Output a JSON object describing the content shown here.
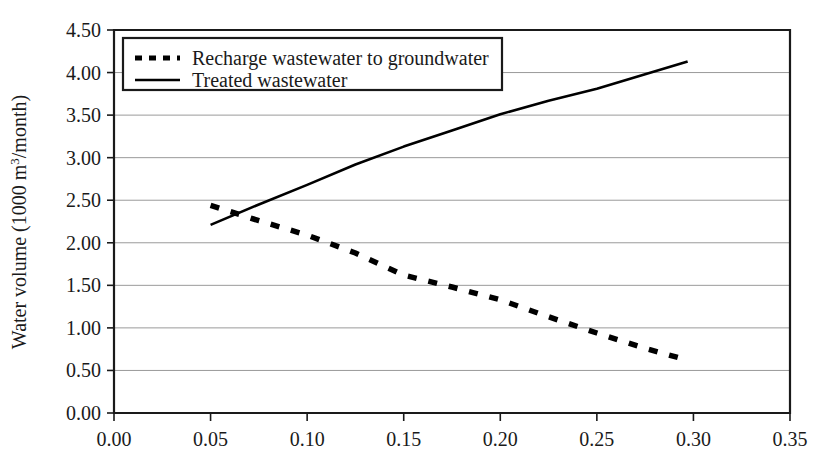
{
  "chart_data": {
    "type": "line",
    "title": "",
    "xlabel": "",
    "ylabel": "Water volume (1000 m³/month)",
    "ylabel_parts": {
      "before": "Water volume (1000 m",
      "sup": "3",
      "after": "/month)"
    },
    "xlim": [
      0.0,
      0.35
    ],
    "ylim": [
      0.0,
      4.5
    ],
    "xticks": [
      "0.00",
      "0.05",
      "0.10",
      "0.15",
      "0.20",
      "0.25",
      "0.30",
      "0.35"
    ],
    "xtick_values": [
      0.0,
      0.05,
      0.1,
      0.15,
      0.2,
      0.25,
      0.3,
      0.35
    ],
    "yticks": [
      "0.00",
      "0.50",
      "1.00",
      "1.50",
      "2.00",
      "2.50",
      "3.00",
      "3.50",
      "4.00",
      "4.50"
    ],
    "ytick_values": [
      0.0,
      0.5,
      1.0,
      1.5,
      2.0,
      2.5,
      3.0,
      3.5,
      4.0,
      4.5
    ],
    "grid": "horizontal",
    "legend_position": "top-left-inside",
    "series": [
      {
        "name": "Recharge wastewater to groundwater",
        "style": "dashed",
        "color": "#000000",
        "x": [
          0.05,
          0.075,
          0.1,
          0.125,
          0.15,
          0.175,
          0.2,
          0.225,
          0.25,
          0.275,
          0.297
        ],
        "values": [
          2.44,
          2.26,
          2.09,
          1.88,
          1.62,
          1.48,
          1.33,
          1.13,
          0.94,
          0.76,
          0.62
        ]
      },
      {
        "name": "Treated wastewater",
        "style": "solid",
        "color": "#000000",
        "x": [
          0.05,
          0.075,
          0.1,
          0.125,
          0.15,
          0.175,
          0.2,
          0.225,
          0.25,
          0.275,
          0.297
        ],
        "values": [
          2.21,
          2.45,
          2.68,
          2.92,
          3.13,
          3.32,
          3.51,
          3.67,
          3.81,
          3.98,
          4.13
        ]
      }
    ]
  },
  "legend": {
    "entries": [
      {
        "label": "Recharge wastewater to groundwater",
        "style": "dashed"
      },
      {
        "label": "Treated wastewater",
        "style": "solid"
      }
    ]
  },
  "colors": {
    "axis": "#1a1a1a",
    "grid": "#9a9a9a",
    "series": "#000000",
    "background": "#ffffff"
  }
}
